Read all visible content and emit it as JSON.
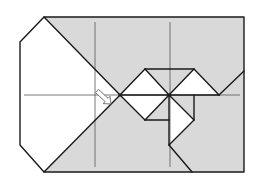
{
  "diagram": {
    "type": "origami-fold-step",
    "width": 263,
    "height": 189,
    "colors": {
      "background": "#ffffff",
      "paper_colored": "#d9d9d9",
      "paper_white": "#ffffff",
      "stroke": "#1a1a1a",
      "fold_line": "#555555",
      "arrow_fill": "#ffffff",
      "arrow_stroke": "#666666"
    },
    "paper_outline": [
      [
        44,
        17
      ],
      [
        244,
        17
      ],
      [
        244,
        172
      ],
      [
        44,
        172
      ],
      [
        20,
        145
      ],
      [
        20,
        42
      ]
    ],
    "white_flap_left": [
      [
        44,
        17
      ],
      [
        120,
        95
      ],
      [
        44,
        172
      ],
      [
        20,
        145
      ],
      [
        20,
        42
      ]
    ],
    "white_regions": [
      [
        [
          145,
          69
        ],
        [
          120,
          95
        ],
        [
          169,
          95
        ]
      ],
      [
        [
          120,
          95
        ],
        [
          169,
          95
        ],
        [
          145,
          120
        ]
      ],
      [
        [
          194,
          69
        ],
        [
          169,
          95
        ],
        [
          219,
          95
        ]
      ],
      [
        [
          169,
          95
        ],
        [
          194,
          120
        ],
        [
          169,
          145
        ]
      ]
    ],
    "edges": [
      [
        [
          145,
          69
        ],
        [
          194,
          69
        ]
      ],
      [
        [
          120,
          95
        ],
        [
          145,
          69
        ]
      ],
      [
        [
          145,
          69
        ],
        [
          169,
          95
        ]
      ],
      [
        [
          169,
          95
        ],
        [
          194,
          69
        ]
      ],
      [
        [
          194,
          69
        ],
        [
          219,
          95
        ]
      ],
      [
        [
          219,
          95
        ],
        [
          244,
          71
        ]
      ],
      [
        [
          120,
          95
        ],
        [
          219,
          95
        ]
      ],
      [
        [
          120,
          95
        ],
        [
          145,
          120
        ]
      ],
      [
        [
          145,
          120
        ],
        [
          169,
          120
        ]
      ],
      [
        [
          145,
          120
        ],
        [
          169,
          95
        ]
      ],
      [
        [
          169,
          95
        ],
        [
          194,
          120
        ]
      ],
      [
        [
          194,
          95
        ],
        [
          194,
          120
        ]
      ],
      [
        [
          194,
          120
        ],
        [
          169,
          145
        ]
      ],
      [
        [
          169,
          95
        ],
        [
          169,
          145
        ]
      ],
      [
        [
          169,
          145
        ],
        [
          192,
          172
        ]
      ],
      [
        [
          44,
          17
        ],
        [
          120,
          95
        ]
      ],
      [
        [
          120,
          95
        ],
        [
          44,
          172
        ]
      ]
    ],
    "fold_lines": [
      [
        [
          95,
          22
        ],
        [
          95,
          167
        ]
      ],
      [
        [
          170,
          22
        ],
        [
          170,
          167
        ]
      ],
      [
        [
          24,
          95
        ],
        [
          240,
          95
        ]
      ]
    ],
    "pivot_points": [
      [
        120,
        95
      ],
      [
        169,
        95
      ]
    ],
    "arrow": {
      "label": "push-arrow",
      "from": [
        97,
        91
      ],
      "to": [
        111,
        104
      ]
    }
  }
}
